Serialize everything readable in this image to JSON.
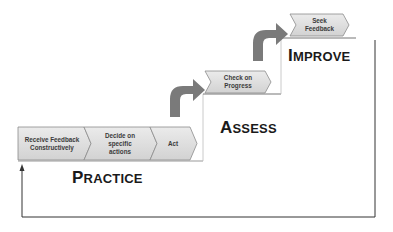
{
  "diagram": {
    "stages": [
      {
        "id": "practice",
        "first": "P",
        "rest": "RACTICE"
      },
      {
        "id": "assess",
        "first": "A",
        "rest": "SSESS"
      },
      {
        "id": "improve",
        "first": "I",
        "rest": "MPROVE"
      }
    ],
    "steps": [
      {
        "label_lines": [
          "Receive Feedback",
          "Constructively"
        ]
      },
      {
        "label_lines": [
          "Decide on",
          "specific",
          "actions"
        ]
      },
      {
        "label_lines": [
          "Act"
        ]
      },
      {
        "label_lines": [
          "Check on",
          "Progress"
        ]
      },
      {
        "label_lines": [
          "Seek",
          "Feedback"
        ]
      }
    ],
    "colors": {
      "chevron_fill": "#dcdcdc",
      "chevron_stroke": "#8c8c8c",
      "arrow_fill": "#7a7a7a",
      "line": "#333333",
      "text": "#1a1a1a"
    }
  }
}
